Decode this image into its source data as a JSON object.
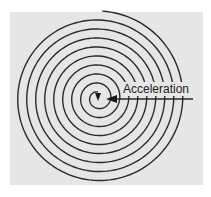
{
  "diagram": {
    "type": "spiral",
    "label": "Acceleration",
    "colors": {
      "background": "#e6e6e6",
      "stroke": "#2a2a2a"
    },
    "spiral": {
      "center": [
        98,
        98
      ],
      "turns": 9,
      "spacing": 9,
      "inner_radius": 6
    }
  }
}
